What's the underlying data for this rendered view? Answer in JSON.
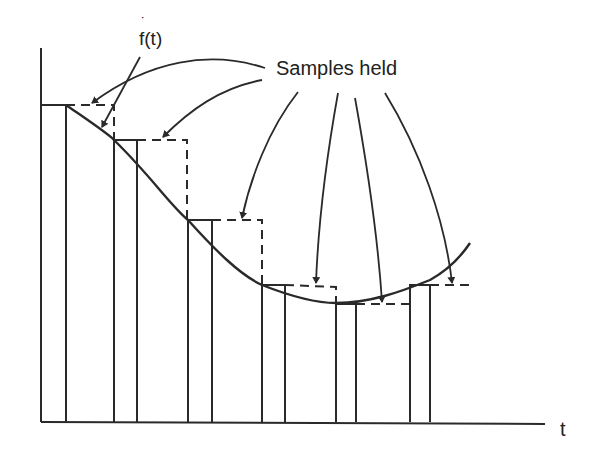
{
  "diagram": {
    "title_label": "Samples held",
    "curve_label": "f(t)",
    "curve_label_accent": "˙",
    "x_axis_label": "t",
    "colors": {
      "ink": "#2a2a2a",
      "background": "#ffffff"
    },
    "samples": [
      {
        "index": 1,
        "pulse_start_x": 41,
        "pulse_end_x": 66,
        "held_level_y": 105,
        "hold_end_x": 114
      },
      {
        "index": 2,
        "pulse_start_x": 114,
        "pulse_end_x": 137,
        "held_level_y": 140,
        "hold_end_x": 188
      },
      {
        "index": 3,
        "pulse_start_x": 188,
        "pulse_end_x": 212,
        "held_level_y": 220,
        "hold_end_x": 262
      },
      {
        "index": 4,
        "pulse_start_x": 262,
        "pulse_end_x": 285,
        "held_level_y": 285,
        "hold_end_x": 336
      },
      {
        "index": 5,
        "pulse_start_x": 336,
        "pulse_end_x": 356,
        "held_level_y": 304,
        "hold_end_x": 410
      },
      {
        "index": 6,
        "pulse_start_x": 410,
        "pulse_end_x": 430,
        "held_level_y": 285,
        "hold_end_x": 470
      }
    ]
  }
}
